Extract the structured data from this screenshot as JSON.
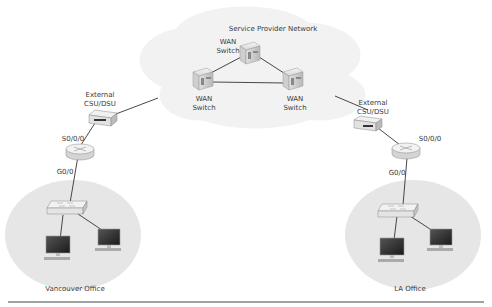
{
  "cloud": {
    "title": "Service Provider Network",
    "switches": [
      {
        "id": "wan-top",
        "label_line1": "WAN",
        "label_line2": "Switch"
      },
      {
        "id": "wan-left",
        "label_line1": "WAN",
        "label_line2": "Switch"
      },
      {
        "id": "wan-right",
        "label_line1": "WAN",
        "label_line2": "Switch"
      }
    ]
  },
  "sites": {
    "vancouver": {
      "name": "Vancouver Office",
      "csu_label_line1": "External",
      "csu_label_line2": "CSU/DSU",
      "serial_iface": "S0/0/0",
      "gig_iface": "G0/0"
    },
    "la": {
      "name": "LA Office",
      "csu_label_line1": "External",
      "csu_label_line2": "CSU/DSU",
      "serial_iface": "S0/0/0",
      "gig_iface": "G0/0"
    }
  },
  "colors": {
    "cloud_fill": "#f2f2f2",
    "site_fill": "#e6e6e6",
    "link": "#333333",
    "rule": "#444444"
  }
}
